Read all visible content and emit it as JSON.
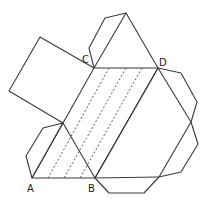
{
  "diagram": {
    "labels": {
      "A": "A",
      "B": "B",
      "C": "C",
      "D": "D"
    },
    "vertices": {
      "A": [
        32,
        178
      ],
      "B": [
        95,
        178
      ],
      "C": [
        94,
        68
      ],
      "D": [
        158,
        68
      ],
      "left_apex": [
        63,
        123
      ],
      "top_apex": [
        126,
        13
      ],
      "right_apex": [
        191,
        122
      ]
    },
    "fold_lines": 3,
    "colors": {
      "line": "#3a3a3a",
      "background": "#ffffff"
    }
  }
}
